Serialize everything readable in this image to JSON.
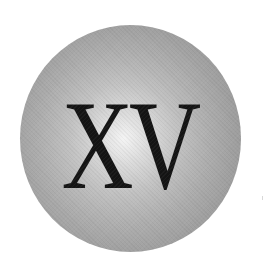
{
  "badge": {
    "text": "XV",
    "shape": "sphere",
    "colors": {
      "background": "#ffffff",
      "sphere_highlight": "#f4f4f4",
      "sphere_mid": "#c2c2c2",
      "sphere_edge": "#979797",
      "text": "#141414"
    }
  }
}
